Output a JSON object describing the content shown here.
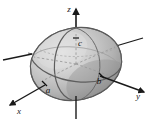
{
  "figure": {
    "background_color": "#ffffff",
    "surface_color": "#b8b8b8",
    "surface_highlight_color": "#e4e4e4",
    "surface_shadow_color": "#8d8d8d",
    "outline_color": "#5a5a5a",
    "axis_color": "#1a1a1a",
    "dashed_line_color": "#9a9a9a"
  },
  "axes": [
    {
      "id": "z",
      "label": "z",
      "direction": "up",
      "label_x": 69,
      "label_y": 12
    },
    {
      "id": "y",
      "label": "y",
      "direction": "lower-right",
      "label_x": 138,
      "label_y": 99
    },
    {
      "id": "x",
      "label": "x",
      "direction": "lower-left",
      "label_x": 19,
      "label_y": 114
    }
  ],
  "semi_axes": [
    {
      "id": "a",
      "label": "a",
      "axis": "x",
      "label_x": 48,
      "label_y": 93
    },
    {
      "id": "b",
      "label": "b",
      "axis": "y",
      "label_x": 99,
      "label_y": 84
    },
    {
      "id": "c",
      "label": "c",
      "axis": "z",
      "label_x": 80,
      "label_y": 46
    }
  ]
}
